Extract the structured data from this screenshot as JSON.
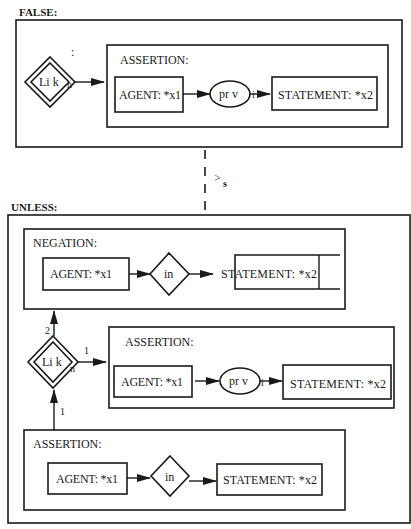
{
  "colors": {
    "ink": "#1a1a1a",
    "background": "#ffffff"
  },
  "false_context": {
    "heading": "FALSE:",
    "link_node": {
      "label": "Li k",
      "suffix": "n",
      "marker": ":"
    },
    "assertion": {
      "heading": "ASSERTION:",
      "agent": "AGENT: *x1",
      "relation": "pr v",
      "relation_mark": "i",
      "statement": "STATEMENT:  *x2"
    }
  },
  "relation_between": {
    "symbol": ">",
    "subscript": "s"
  },
  "unless_context": {
    "heading": "UNLESS:",
    "negation": {
      "heading": "NEGATION:",
      "agent": "AGENT: *x1",
      "relation": "in",
      "statement": "STATEMENT:  *x2"
    },
    "link_node": {
      "label": "Li k",
      "suffix": "n",
      "arc_up_label": "2",
      "arc_right_label": "1",
      "arc_in_label": "1"
    },
    "assertion_middle": {
      "heading": "ASSERTION:",
      "agent": "AGENT: *x1",
      "relation": "pr v",
      "relation_mark": "i",
      "statement": "STATEMENT:  *x2"
    },
    "assertion_bottom": {
      "heading": "ASSERTION:",
      "agent": "AGENT: *x1",
      "relation": "in",
      "statement": "STATEMENT:  *x2"
    }
  }
}
